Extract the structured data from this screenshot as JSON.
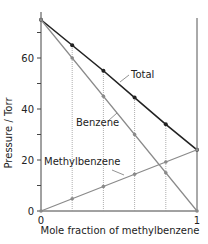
{
  "chart_data": {
    "type": "line",
    "title": "",
    "xlabel": "Mole fraction of methylbenzene",
    "ylabel": "Pressure / Torr",
    "xlim": [
      0,
      1
    ],
    "ylim": [
      0,
      80
    ],
    "x_ticks": [
      "0",
      "1"
    ],
    "y_ticks": [
      "0",
      "20",
      "40",
      "60"
    ],
    "grid": false,
    "x": [
      0,
      0.2,
      0.4,
      0.6,
      0.8,
      1.0
    ],
    "series": [
      {
        "name": "Total",
        "values": [
          75,
          65,
          55,
          44.5,
          34,
          24
        ],
        "color": "#222222"
      },
      {
        "name": "Benzene",
        "values": [
          75,
          60,
          45,
          30,
          15,
          0
        ],
        "color": "#8a8a8a"
      },
      {
        "name": "Methylbenzene",
        "values": [
          0,
          4.8,
          9.6,
          14.4,
          19.2,
          24
        ],
        "color": "#8a8a8a"
      }
    ],
    "annotations": [
      "Total",
      "Benzene",
      "Methylbenzene"
    ],
    "legend": "inline labels"
  }
}
